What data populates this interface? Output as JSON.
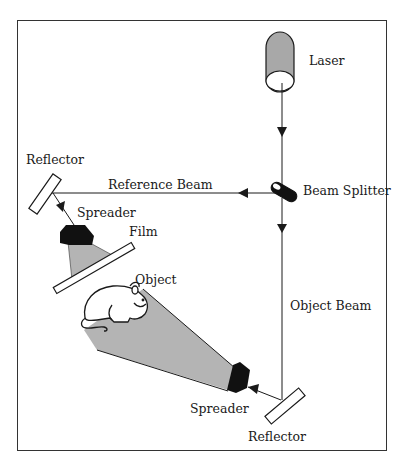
{
  "diagram": {
    "type": "holography-setup",
    "labels": {
      "laser": "Laser",
      "beam_splitter": "Beam Splitter",
      "reference_beam": "Reference Beam",
      "reflector_top": "Reflector",
      "spreader_top": "Spreader",
      "film": "Film",
      "object": "Object",
      "object_beam": "Object Beam",
      "spreader_bottom": "Spreader",
      "reflector_bottom": "Reflector"
    },
    "colors": {
      "line": "#1a1a1a",
      "beam_fill": "#b4b4b4",
      "laser_fill": "#a8a8a8",
      "spreader_fill": "#111111",
      "background": "#ffffff"
    }
  }
}
